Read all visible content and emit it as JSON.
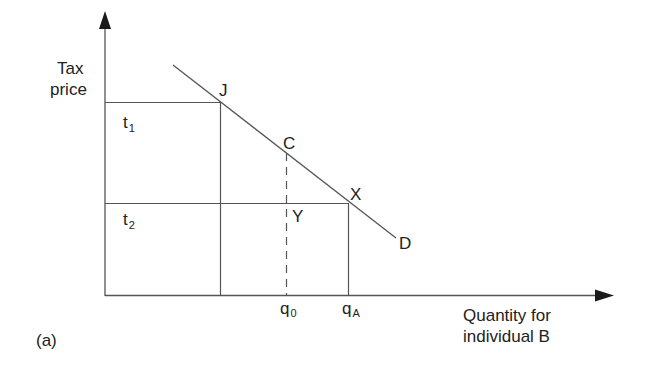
{
  "figure": {
    "panel_label": "(a)",
    "y_axis": {
      "label_line1": "Tax",
      "label_line2": "price"
    },
    "x_axis": {
      "label_line1": "Quantity for",
      "label_line2": "individual B"
    },
    "tax_prices": [
      {
        "base": "t",
        "sub": "1"
      },
      {
        "base": "t",
        "sub": "2"
      }
    ],
    "quantities": [
      {
        "base": "q",
        "sub": "0"
      },
      {
        "base": "q",
        "sub": "A"
      }
    ],
    "points": {
      "J": "J",
      "C": "C",
      "X": "X",
      "Y": "Y"
    },
    "curve_label": "D",
    "colors": {
      "line": "#555555",
      "text": "#222222",
      "background": "#ffffff"
    }
  }
}
